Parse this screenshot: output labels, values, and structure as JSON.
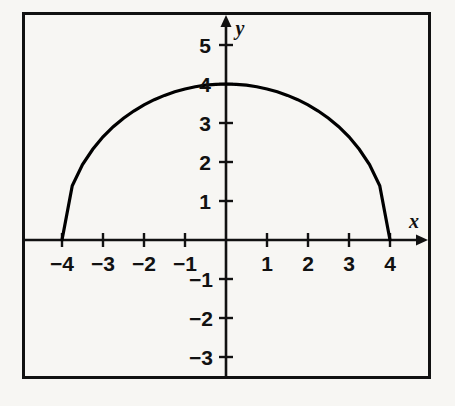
{
  "figure": {
    "background_color": "#f7f6f3",
    "frame_color": "#111111",
    "axis_color": "#111111",
    "curve_color": "#000000",
    "x_axis_name": "x",
    "y_axis_name": "y"
  },
  "chart_data": {
    "type": "line",
    "title": "",
    "subtitle": "",
    "xlabel": "x",
    "ylabel": "y",
    "xlim": [
      -5,
      5
    ],
    "ylim": [
      -3.6,
      5.6
    ],
    "grid": false,
    "legend": null,
    "x_ticks": [
      -4,
      -3,
      -2,
      -1,
      1,
      2,
      3,
      4
    ],
    "x_tick_labels": [
      "−4",
      "−3",
      "−2",
      "−1",
      "1",
      "2",
      "3",
      "4"
    ],
    "y_ticks": [
      -3,
      -2,
      -1,
      1,
      2,
      3,
      4,
      5
    ],
    "y_tick_labels": [
      "−3",
      "−2",
      "−1",
      "1",
      "2",
      "3",
      "4",
      "5"
    ],
    "annotations": [],
    "series": [
      {
        "name": "upper semicircle radius 4",
        "equation": "y = sqrt(16 - x^2)",
        "domain": [
          -4,
          4
        ],
        "x": [
          -4,
          -3.75,
          -3.5,
          -3.25,
          -3,
          -2.75,
          -2.5,
          -2.25,
          -2,
          -1.75,
          -1.5,
          -1.25,
          -1,
          -0.75,
          -0.5,
          -0.25,
          0,
          0.25,
          0.5,
          0.75,
          1,
          1.25,
          1.5,
          1.75,
          2,
          2.25,
          2.5,
          2.75,
          3,
          3.25,
          3.5,
          3.75,
          4
        ],
        "y": [
          0,
          1.392,
          1.936,
          2.327,
          2.646,
          2.905,
          3.122,
          3.307,
          3.464,
          3.598,
          3.708,
          3.8,
          3.873,
          3.929,
          3.969,
          3.992,
          4,
          3.992,
          3.969,
          3.929,
          3.873,
          3.8,
          3.708,
          3.598,
          3.464,
          3.307,
          3.122,
          2.905,
          2.646,
          2.327,
          1.936,
          1.392,
          0
        ]
      }
    ]
  },
  "labels": {
    "x_neg4": "−4",
    "x_neg3": "−3",
    "x_neg2": "−2",
    "x_neg1": "−1",
    "x_1": "1",
    "x_2": "2",
    "x_3": "3",
    "x_4": "4",
    "y_5": "5",
    "y_4": "4",
    "y_3": "3",
    "y_2": "2",
    "y_1": "1",
    "y_neg1": "−1",
    "y_neg2": "−2",
    "y_neg3": "−3",
    "axis_x": "x",
    "axis_y": "y"
  }
}
